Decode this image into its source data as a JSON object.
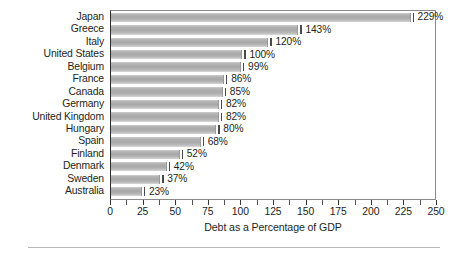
{
  "chart_data": {
    "type": "bar",
    "orientation": "horizontal",
    "title": "",
    "xlabel": "Debt as a Percentage of GDP",
    "ylabel": "",
    "xlim": [
      0,
      250
    ],
    "xticks": [
      0,
      25,
      50,
      75,
      100,
      125,
      150,
      175,
      200,
      225,
      250
    ],
    "xtick_labels": [
      "0",
      "25",
      "50",
      "75",
      "100",
      "125",
      "150",
      "175",
      "200",
      "225",
      "250"
    ],
    "minor_tick_step": 12.5,
    "grid": false,
    "legend": null,
    "value_label_suffix": "%",
    "categories": [
      "Japan",
      "Greece",
      "Italy",
      "United States",
      "Belgium",
      "France",
      "Canada",
      "Germany",
      "United Kingdom",
      "Hungary",
      "Spain",
      "Finland",
      "Denmark",
      "Sweden",
      "Australia"
    ],
    "values": [
      229,
      143,
      120,
      100,
      99,
      86,
      85,
      82,
      82,
      80,
      68,
      52,
      42,
      37,
      23
    ],
    "value_labels": [
      "229%",
      "143%",
      "120%",
      "100%",
      "99%",
      "86%",
      "85%",
      "82%",
      "82%",
      "80%",
      "68%",
      "52%",
      "42%",
      "37%",
      "23%"
    ],
    "bar_color": "#a8a8a8",
    "frame_color": "#8a8a8a",
    "axis_color": "#2d2d2d",
    "text_color": "#231f20",
    "background": "#ffffff"
  },
  "axis": {
    "xlabel": "Debt as a Percentage of GDP"
  }
}
